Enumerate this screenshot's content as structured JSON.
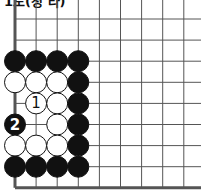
{
  "title": "1도(정 타)",
  "board": {
    "origin_x": 15,
    "origin_y": 19,
    "spacing": 21.1,
    "cols": 9,
    "rows": 9,
    "edges": [
      "left",
      "bottom"
    ],
    "stone_radius": 10.5,
    "stones": [
      {
        "c": 0,
        "r": 2,
        "color": "black"
      },
      {
        "c": 1,
        "r": 2,
        "color": "black"
      },
      {
        "c": 2,
        "r": 2,
        "color": "black"
      },
      {
        "c": 3,
        "r": 2,
        "color": "black"
      },
      {
        "c": 0,
        "r": 3,
        "color": "white"
      },
      {
        "c": 1,
        "r": 3,
        "color": "white"
      },
      {
        "c": 2,
        "r": 3,
        "color": "white"
      },
      {
        "c": 3,
        "r": 3,
        "color": "black"
      },
      {
        "c": 1,
        "r": 4,
        "color": "white",
        "label": "1"
      },
      {
        "c": 2,
        "r": 4,
        "color": "white"
      },
      {
        "c": 3,
        "r": 4,
        "color": "black"
      },
      {
        "c": 0,
        "r": 5,
        "color": "black",
        "label": "2"
      },
      {
        "c": 2,
        "r": 5,
        "color": "white"
      },
      {
        "c": 3,
        "r": 5,
        "color": "black"
      },
      {
        "c": 0,
        "r": 6,
        "color": "white"
      },
      {
        "c": 1,
        "r": 6,
        "color": "white"
      },
      {
        "c": 2,
        "r": 6,
        "color": "white"
      },
      {
        "c": 3,
        "r": 6,
        "color": "black"
      },
      {
        "c": 0,
        "r": 7,
        "color": "black"
      },
      {
        "c": 1,
        "r": 7,
        "color": "black"
      },
      {
        "c": 2,
        "r": 7,
        "color": "black"
      },
      {
        "c": 3,
        "r": 7,
        "color": "black"
      }
    ]
  }
}
